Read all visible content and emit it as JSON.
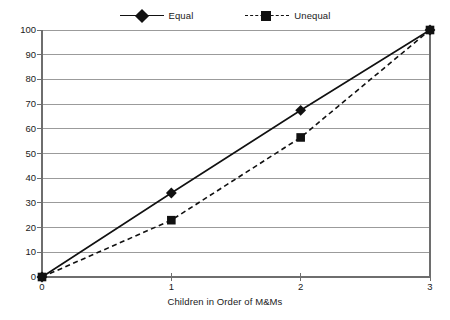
{
  "chart_data": {
    "type": "line",
    "title": "",
    "xlabel": "Children in Order of M&Ms",
    "ylabel": "",
    "x": [
      0,
      1,
      2,
      3
    ],
    "categories": [
      "0",
      "1",
      "2",
      "3"
    ],
    "xlim": [
      0,
      3
    ],
    "ylim": [
      0,
      100
    ],
    "y_tick_step": 10,
    "y_tick_labels": [
      "100",
      "90",
      "80",
      "70",
      "60",
      "50",
      "40",
      "30",
      "20",
      "10",
      "0"
    ],
    "x_tick_labels": [
      "0",
      "1",
      "2",
      "3"
    ],
    "grid": "horizontal",
    "legend_position": "top-center",
    "series": [
      {
        "name": "Equal",
        "values": [
          0,
          34,
          67.5,
          100
        ],
        "line_style": "solid",
        "marker": "diamond",
        "color": "#111111"
      },
      {
        "name": "Unequal",
        "values": [
          0,
          23,
          56.5,
          100
        ],
        "line_style": "dashed",
        "marker": "square",
        "color": "#111111"
      }
    ],
    "colors": {
      "gridline": "#9b9b9b",
      "axis": "#6e6e6e",
      "series": "#111111",
      "background": "#ffffff",
      "text": "#1a1a1a"
    }
  },
  "legend": {
    "entries": [
      {
        "label": "Equal"
      },
      {
        "label": "Unequal"
      }
    ]
  },
  "axes": {
    "x_title": "Children in Order of M&Ms"
  }
}
